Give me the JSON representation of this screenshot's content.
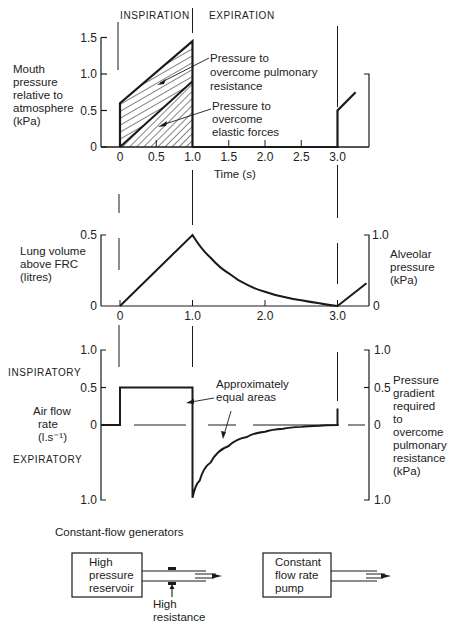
{
  "chart_data": [
    {
      "id": "mouth_pressure",
      "type": "area",
      "title": "",
      "phase_labels": [
        "INSPIRATION",
        "EXPIRATION"
      ],
      "ylabel": [
        "Mouth",
        "pressure",
        "relative to",
        "atmosphere",
        "(kPa)"
      ],
      "xlabel": "Time (s)",
      "xlim": [
        0,
        3.4
      ],
      "ylim": [
        0,
        1.5
      ],
      "xticks": [
        0,
        0.5,
        1.0,
        1.5,
        2.0,
        2.5,
        3.0
      ],
      "xtick_labels": [
        "0",
        "0.5",
        "1.0",
        "1.5",
        "2.0",
        "2.5",
        "3.0"
      ],
      "yticks": [
        0,
        0.5,
        1.0,
        1.5
      ],
      "ytick_labels": [
        "0",
        "0.5",
        "1.0",
        "1.5"
      ],
      "series": [
        {
          "name": "Total mouth pressure",
          "x": [
            0,
            0,
            1.0,
            1.0,
            3.0,
            3.0,
            3.25
          ],
          "y": [
            0,
            0.6,
            1.45,
            0,
            0,
            0.5,
            0.75
          ]
        },
        {
          "name": "Elastic component boundary",
          "x": [
            0,
            1.0
          ],
          "y": [
            0,
            0.9
          ]
        }
      ],
      "annotations": [
        {
          "text": [
            "Pressure to",
            "overcome pulmonary",
            "resistance"
          ],
          "points_to": "upper hatched region"
        },
        {
          "text": [
            "Pressure to",
            "overcome",
            "elastic forces"
          ],
          "points_to": "lower hatched region"
        }
      ]
    },
    {
      "id": "lung_volume",
      "type": "line",
      "ylabel": [
        "Lung volume",
        "above FRC",
        "(litres)"
      ],
      "ylabel_right": [
        "Alveolar",
        "pressure",
        "(kPa)"
      ],
      "xlim": [
        0,
        3.4
      ],
      "ylim": [
        0,
        0.5
      ],
      "ylim_right": [
        0,
        1.0
      ],
      "xticks": [
        0,
        1.0,
        2.0,
        3.0
      ],
      "xtick_labels": [
        "0",
        "1.0",
        "2.0",
        "3.0"
      ],
      "ytick_labels": [
        "0",
        "0.5"
      ],
      "ytick_labels_right": [
        "0",
        "1.0"
      ],
      "series": [
        {
          "name": "Lung volume",
          "x": [
            0,
            1.0,
            1.25,
            1.5,
            1.75,
            2.0,
            2.25,
            2.5,
            2.75,
            3.0,
            3.4
          ],
          "y": [
            0,
            0.5,
            0.34,
            0.23,
            0.15,
            0.1,
            0.065,
            0.04,
            0.02,
            0.0,
            0.16
          ]
        }
      ]
    },
    {
      "id": "air_flow",
      "type": "line",
      "ylabel": [
        "Air flow",
        "rate",
        "(l.s⁻¹)"
      ],
      "ylabel_right": [
        "Pressure",
        "gradient",
        "required",
        "to",
        "overcome",
        "pulmonary",
        "resistance",
        "(kPa)"
      ],
      "direction_labels": [
        "INSPIRATORY",
        "EXPIRATORY"
      ],
      "xlim": [
        -0.3,
        3.4
      ],
      "ylim": [
        -1.0,
        1.0
      ],
      "ytick_labels": [
        "1.0",
        "0.5",
        "0",
        "1.0"
      ],
      "ytick_labels_right": [
        "1.0",
        "0.5",
        "0",
        "1.0"
      ],
      "series": [
        {
          "name": "Air flow",
          "x": [
            -0.3,
            0,
            0,
            1.0,
            1.0,
            1.1,
            1.25,
            1.5,
            1.75,
            2.0,
            2.25,
            2.5,
            2.75,
            3.0,
            3.0
          ],
          "y": [
            0,
            0,
            0.5,
            0.5,
            -0.97,
            -0.74,
            -0.5,
            -0.28,
            -0.16,
            -0.09,
            -0.05,
            -0.025,
            -0.01,
            0,
            0.22
          ]
        }
      ],
      "annotations": [
        {
          "text": [
            "Approximately",
            "equal areas"
          ]
        }
      ]
    }
  ],
  "diagram": {
    "title": "Constant-flow generators",
    "reservoir_label": [
      "High",
      "pressure",
      "reservoir"
    ],
    "resistance_label": [
      "High",
      "resistance"
    ],
    "pump_label": [
      "Constant",
      "flow rate",
      "pump"
    ]
  }
}
